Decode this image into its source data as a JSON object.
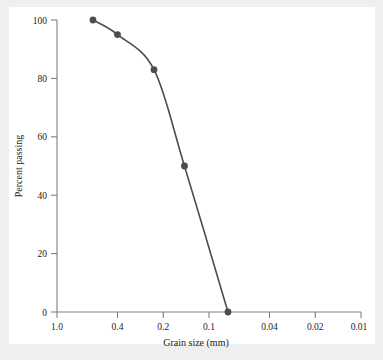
{
  "figure": {
    "background_color": "#efefef",
    "plate_color": "#ffffff"
  },
  "chart_data": {
    "type": "line",
    "title": "",
    "xlabel": "Grain size (mm)",
    "ylabel": "Percent passing",
    "x_scale": "log-reversed",
    "xlim": [
      1.0,
      0.01
    ],
    "ylim": [
      0,
      100
    ],
    "grid": false,
    "legend": null,
    "line_color": "#4d4d4d",
    "marker_color": "#4d4d4d",
    "marker_shape": "circle",
    "axis_color": "#808080",
    "xticks": [
      {
        "value": 1.0,
        "label": "1.0"
      },
      {
        "value": 0.4,
        "label": "0.4"
      },
      {
        "value": 0.2,
        "label": "0.2"
      },
      {
        "value": 0.1,
        "label": "0.1"
      },
      {
        "value": 0.04,
        "label": "0.04"
      },
      {
        "value": 0.02,
        "label": "0.02"
      },
      {
        "value": 0.01,
        "label": "0.01"
      }
    ],
    "yticks": [
      {
        "value": 0,
        "label": "0"
      },
      {
        "value": 20,
        "label": "20"
      },
      {
        "value": 40,
        "label": "40"
      },
      {
        "value": 60,
        "label": "60"
      },
      {
        "value": 80,
        "label": "80"
      },
      {
        "value": 100,
        "label": "100"
      }
    ],
    "x": [
      0.58,
      0.4,
      0.23,
      0.145,
      0.075
    ],
    "values": [
      100,
      95,
      83,
      50,
      0
    ],
    "points": [
      {
        "grain_size_mm": 0.58,
        "percent_passing": 100
      },
      {
        "grain_size_mm": 0.4,
        "percent_passing": 95
      },
      {
        "grain_size_mm": 0.23,
        "percent_passing": 83
      },
      {
        "grain_size_mm": 0.145,
        "percent_passing": 50
      },
      {
        "grain_size_mm": 0.075,
        "percent_passing": 0
      }
    ]
  }
}
